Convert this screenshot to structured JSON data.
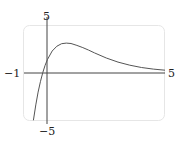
{
  "chart_data": {
    "type": "line",
    "title": "",
    "xlabel": "",
    "ylabel": "",
    "xlim": [
      -1,
      5
    ],
    "ylim": [
      -5,
      5
    ],
    "grid": false,
    "legend": null,
    "tick_labels": {
      "x_min": "−1",
      "x_max": "5",
      "y_max": "5",
      "y_min": "−5"
    },
    "series": [
      {
        "name": "f(x)",
        "x": [
          -0.6,
          -0.5,
          -0.4,
          -0.3,
          -0.2,
          -0.1,
          0.0,
          0.2,
          0.4,
          0.6,
          0.8,
          1.0,
          1.25,
          1.5,
          1.75,
          2.0,
          2.5,
          3.0,
          3.5,
          4.0,
          4.5,
          5.0
        ],
        "values": [
          -5.03,
          -3.41,
          -2.06,
          -0.93,
          0.0,
          0.76,
          1.38,
          2.26,
          2.77,
          3.03,
          3.1,
          3.05,
          2.85,
          2.62,
          2.36,
          2.06,
          1.53,
          1.1,
          0.77,
          0.53,
          0.36,
          0.24
        ]
      }
    ],
    "line_color": "#555555",
    "axis_color": "#444444",
    "frame_color": "#e6e6e6"
  }
}
